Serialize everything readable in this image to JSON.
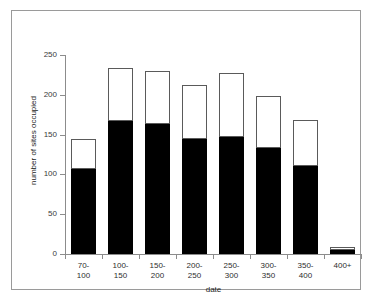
{
  "chart_data": {
    "type": "bar",
    "stacked": true,
    "title": "",
    "xlabel": "date",
    "ylabel": "number of sites occupied",
    "categories": [
      "70-\n100",
      "100-\n150",
      "150-\n200",
      "200-\n250",
      "250-\n300",
      "300-\n350",
      "350-\n400",
      "400+"
    ],
    "category_labels_flat": [
      "70-100",
      "100-150",
      "150-200",
      "200-250",
      "250-300",
      "300-350",
      "350-400",
      "400+"
    ],
    "series": [
      {
        "name": "lower",
        "fill": "#000000",
        "values": [
          107,
          167,
          163,
          145,
          147,
          133,
          111,
          5
        ]
      },
      {
        "name": "upper",
        "fill": "#ffffff",
        "values": [
          37,
          67,
          67,
          67,
          80,
          66,
          57,
          4
        ]
      }
    ],
    "totals": [
      144,
      234,
      230,
      212,
      227,
      199,
      168,
      9
    ],
    "ylim": [
      0,
      250
    ],
    "yticks": [
      0,
      50,
      100,
      150,
      200,
      250
    ],
    "ytick_labels": [
      "0",
      "50",
      "100",
      "150",
      "200",
      "250"
    ],
    "grid": false,
    "legend": "none",
    "axis_color": "#8c8c8c",
    "frame_color": "#9a9a9a",
    "background": "#ffffff"
  }
}
